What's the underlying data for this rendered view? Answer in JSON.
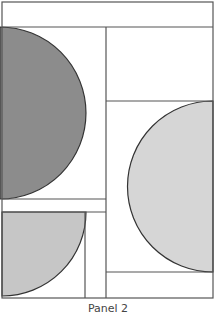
{
  "caption": "Panel 2",
  "colors": {
    "stroke": "#333333",
    "border": "#555555",
    "dark_fill": "#8c8c8c",
    "light_fill": "#d6d6d6",
    "mid_fill": "#c6c6c6",
    "background": "#ffffff"
  },
  "frame": {
    "x": 2,
    "y": 2,
    "width": 211,
    "height": 296
  },
  "lines": [
    {
      "name": "top-strip-divider",
      "x1": 2,
      "y1": 27,
      "x2": 213,
      "y2": 27
    },
    {
      "name": "center-vertical-divider",
      "x1": 106,
      "y1": 27,
      "x2": 106,
      "y2": 298
    },
    {
      "name": "right-upper-divider",
      "x1": 106,
      "y1": 101,
      "x2": 213,
      "y2": 101
    },
    {
      "name": "left-middle-divider-top",
      "x1": 2,
      "y1": 199,
      "x2": 106,
      "y2": 199
    },
    {
      "name": "left-middle-divider-bottom",
      "x1": 2,
      "y1": 212,
      "x2": 106,
      "y2": 212
    },
    {
      "name": "left-lower-vertical",
      "x1": 85,
      "y1": 212,
      "x2": 85,
      "y2": 298
    },
    {
      "name": "right-lower-divider",
      "x1": 106,
      "y1": 272,
      "x2": 213,
      "y2": 272
    }
  ],
  "shapes": [
    {
      "name": "dark-half-circle",
      "type": "half-circle-right",
      "cx": 0,
      "cy": 113,
      "r": 86,
      "fill": "dark_fill"
    },
    {
      "name": "light-half-circle",
      "type": "half-circle-left",
      "cx": 213,
      "cy": 186.5,
      "r": 85.5,
      "fill": "light_fill"
    },
    {
      "name": "quarter-circle",
      "type": "quarter-circle",
      "cx": 2,
      "cy": 212,
      "r": 84,
      "fill": "mid_fill"
    }
  ]
}
